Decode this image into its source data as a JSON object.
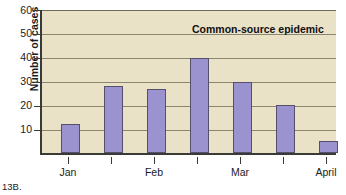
{
  "figure": {
    "caption": "13B."
  },
  "chart_data": {
    "type": "bar",
    "title": "Common-source epidemic",
    "xlabel": "",
    "ylabel": "Number of cases",
    "categories": [
      "Jan",
      "",
      "Feb",
      "",
      "Mar",
      "",
      "April"
    ],
    "tick_labels": [
      "Jan",
      "Feb",
      "Mar",
      "April"
    ],
    "values": [
      12,
      28,
      27,
      40,
      30,
      20,
      5
    ],
    "ylim": [
      0,
      60
    ],
    "ytick_labels": [
      "60",
      "50",
      "40",
      "30",
      "20",
      "10"
    ],
    "yticks": [
      60,
      50,
      40,
      30,
      20,
      10
    ],
    "grid": true,
    "legend": "none",
    "colors": {
      "bar_fill": "#9a93cf",
      "bar_edge": "#54506e",
      "plot_background": "#e9e2c6",
      "axis": "#3a3a36",
      "gridline": "#8c8670",
      "text": "#1b1b1b"
    }
  }
}
